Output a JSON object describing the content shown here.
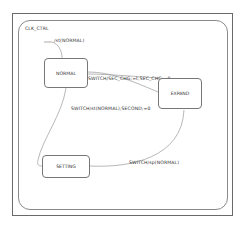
{
  "diagram": {
    "type": "state-machine",
    "container_label": "CLK_CTRL",
    "states": [
      {
        "id": "normal",
        "label": "NORMAL"
      },
      {
        "id": "expand",
        "label": "EXPAND"
      },
      {
        "id": "setting",
        "label": "SETTING"
      }
    ],
    "transitions": [
      {
        "from": "initial",
        "to": "normal",
        "label": "/st(NORMAL)"
      },
      {
        "from": "normal",
        "to": "expand",
        "label": "SWITCH/SEC_CHG;=t;SEC_CHG;=0"
      },
      {
        "from": "normal",
        "to": "setting",
        "label": "SWITCH/st(NORMAL);SECOND;=0"
      },
      {
        "from": "setting",
        "to": "expand",
        "label": "SWITCH/sp(NORMAL)"
      }
    ]
  }
}
